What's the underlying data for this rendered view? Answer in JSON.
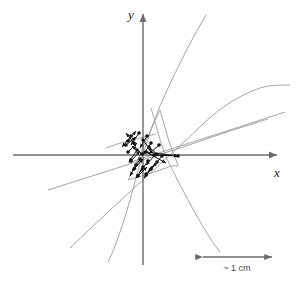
{
  "figure": {
    "background_color": "#ffffff",
    "width": 298,
    "height": 284
  },
  "axes": {
    "x_label": "x",
    "y_label": "y",
    "axis_color": "#6b6b6b",
    "origin": {
      "x": 143,
      "y": 155
    },
    "x_axis": {
      "x1": 13,
      "y1": 155,
      "x2": 277,
      "y2": 155
    },
    "y_axis": {
      "x1": 143,
      "y1": 265,
      "x2": 143,
      "y2": 14
    },
    "x_label_pos": {
      "x": 274,
      "y": 177
    },
    "y_label_pos": {
      "x": 128,
      "y": 19
    }
  },
  "scale_bar": {
    "label": "~ 1 cm",
    "color": "#6b6b6b",
    "x1": 203,
    "x2": 272,
    "y": 257,
    "label_pos": {
      "x": 237,
      "y": 271
    }
  },
  "chart_data": {
    "type": "scatter",
    "title": "",
    "xlabel": "x",
    "ylabel": "y",
    "grid": false,
    "legend": null,
    "annotations": [
      "~ 1 cm"
    ],
    "curve_color": "#9a9a9a",
    "point_color": "#111111",
    "arrow_color": "#111111",
    "curves": [
      {
        "name": "curve-1",
        "comment": "upward-opening arc from upper right descending through cluster to lower left",
        "points": [
          [
            206,
            15
          ],
          [
            193,
            38
          ],
          [
            181,
            61
          ],
          [
            170,
            84
          ],
          [
            160,
            106
          ],
          [
            152,
            127
          ],
          [
            146,
            145
          ],
          [
            141,
            160
          ],
          [
            136,
            178
          ],
          [
            130,
            200
          ],
          [
            123,
            223
          ],
          [
            115,
            246
          ],
          [
            108,
            262
          ]
        ]
      },
      {
        "name": "curve-2",
        "comment": "arc from upper-left of cluster bending down to the lower right",
        "points": [
          [
            151,
            108
          ],
          [
            155,
            122
          ],
          [
            159,
            136
          ],
          [
            163,
            149
          ],
          [
            168,
            161
          ],
          [
            176,
            177
          ],
          [
            187,
            198
          ],
          [
            198,
            218
          ],
          [
            210,
            238
          ],
          [
            220,
            252
          ]
        ]
      },
      {
        "name": "curve-3",
        "comment": "shallow straight line rising left-to-right through the cluster",
        "points": [
          [
            48,
            190
          ],
          [
            92,
            176
          ],
          [
            136,
            162
          ],
          [
            180,
            148
          ],
          [
            224,
            133
          ],
          [
            268,
            119
          ]
        ]
      },
      {
        "name": "curve-4",
        "comment": "steeper straight line rising left-to-right from lower left",
        "points": [
          [
            70,
            248
          ],
          [
            108,
            212
          ],
          [
            146,
            177
          ],
          [
            184,
            142
          ],
          [
            222,
            108
          ],
          [
            260,
            88
          ],
          [
            290,
            85
          ]
        ]
      },
      {
        "name": "curve-5",
        "comment": "long shallow ray from cluster toward the far upper right",
        "points": [
          [
            128,
            163
          ],
          [
            165,
            151
          ],
          [
            205,
            138
          ],
          [
            245,
            125
          ],
          [
            285,
            112
          ]
        ]
      },
      {
        "name": "curve-6",
        "comment": "wedge edge descending from above the cluster to its lower-left",
        "points": [
          [
            160,
            110
          ],
          [
            152,
            127
          ],
          [
            145,
            143
          ],
          [
            139,
            157
          ],
          [
            133,
            170
          ],
          [
            128,
            180
          ]
        ]
      },
      {
        "name": "curve-7",
        "comment": "wedge edge descending from above the cluster to its lower-right",
        "points": [
          [
            160,
            110
          ],
          [
            164,
            124
          ],
          [
            168,
            138
          ],
          [
            172,
            150
          ],
          [
            176,
            160
          ],
          [
            178,
            166
          ]
        ]
      },
      {
        "name": "curve-8",
        "comment": "lower boundary of the wedge under the cluster",
        "points": [
          [
            128,
            180
          ],
          [
            145,
            175
          ],
          [
            160,
            170
          ],
          [
            172,
            166
          ],
          [
            178,
            166
          ]
        ]
      },
      {
        "name": "curve-9",
        "comment": "short line along the upper-left of the cluster",
        "points": [
          [
            106,
            148
          ],
          [
            124,
            142
          ],
          [
            140,
            138
          ],
          [
            156,
            134
          ]
        ]
      }
    ],
    "points": [
      [
        131,
        136
      ],
      [
        139,
        133
      ],
      [
        147,
        136
      ],
      [
        126,
        145
      ],
      [
        134,
        143
      ],
      [
        143,
        140
      ],
      [
        151,
        143
      ],
      [
        159,
        145
      ],
      [
        128,
        152
      ],
      [
        137,
        150
      ],
      [
        146,
        152
      ],
      [
        154,
        155
      ],
      [
        162,
        156
      ],
      [
        131,
        161
      ],
      [
        140,
        159
      ],
      [
        148,
        161
      ],
      [
        157,
        162
      ],
      [
        134,
        169
      ],
      [
        143,
        167
      ],
      [
        151,
        169
      ],
      [
        138,
        176
      ],
      [
        146,
        174
      ],
      [
        155,
        155
      ],
      [
        149,
        147
      ],
      [
        142,
        154
      ],
      [
        178,
        156
      ],
      [
        128,
        141
      ],
      [
        136,
        165
      ]
    ],
    "arrows": [
      {
        "x1": 131,
        "y1": 136,
        "x2": 122,
        "y2": 147
      },
      {
        "x1": 139,
        "y1": 133,
        "x2": 131,
        "y2": 145
      },
      {
        "x1": 147,
        "y1": 136,
        "x2": 140,
        "y2": 148
      },
      {
        "x1": 126,
        "y1": 145,
        "x2": 136,
        "y2": 137
      },
      {
        "x1": 134,
        "y1": 143,
        "x2": 126,
        "y2": 133
      },
      {
        "x1": 143,
        "y1": 140,
        "x2": 152,
        "y2": 152
      },
      {
        "x1": 151,
        "y1": 143,
        "x2": 143,
        "y2": 155
      },
      {
        "x1": 159,
        "y1": 145,
        "x2": 149,
        "y2": 154
      },
      {
        "x1": 128,
        "y1": 152,
        "x2": 137,
        "y2": 143
      },
      {
        "x1": 137,
        "y1": 150,
        "x2": 129,
        "y2": 162
      },
      {
        "x1": 146,
        "y1": 152,
        "x2": 178,
        "y2": 156
      },
      {
        "x1": 154,
        "y1": 155,
        "x2": 178,
        "y2": 156
      },
      {
        "x1": 146,
        "y1": 152,
        "x2": 166,
        "y2": 163
      },
      {
        "x1": 131,
        "y1": 161,
        "x2": 140,
        "y2": 151
      },
      {
        "x1": 140,
        "y1": 159,
        "x2": 133,
        "y2": 171
      },
      {
        "x1": 148,
        "y1": 161,
        "x2": 140,
        "y2": 172
      },
      {
        "x1": 157,
        "y1": 162,
        "x2": 148,
        "y2": 172
      },
      {
        "x1": 134,
        "y1": 169,
        "x2": 143,
        "y2": 159
      },
      {
        "x1": 143,
        "y1": 167,
        "x2": 136,
        "y2": 178
      },
      {
        "x1": 151,
        "y1": 169,
        "x2": 144,
        "y2": 178
      },
      {
        "x1": 138,
        "y1": 176,
        "x2": 147,
        "y2": 167
      },
      {
        "x1": 146,
        "y1": 174,
        "x2": 154,
        "y2": 165
      },
      {
        "x1": 128,
        "y1": 141,
        "x2": 136,
        "y2": 131
      },
      {
        "x1": 136,
        "y1": 165,
        "x2": 130,
        "y2": 176
      },
      {
        "x1": 142,
        "y1": 154,
        "x2": 132,
        "y2": 146
      },
      {
        "x1": 149,
        "y1": 147,
        "x2": 159,
        "y2": 156
      },
      {
        "x1": 155,
        "y1": 155,
        "x2": 146,
        "y2": 165
      },
      {
        "x1": 162,
        "y1": 156,
        "x2": 153,
        "y2": 167
      }
    ]
  }
}
